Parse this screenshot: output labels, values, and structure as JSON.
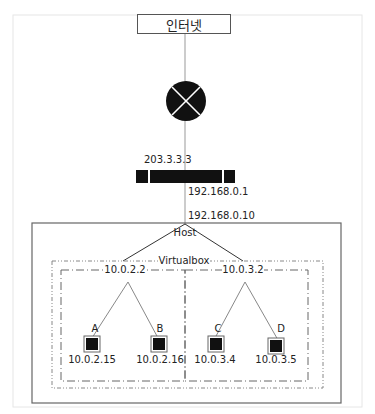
{
  "diagram": {
    "internet": {
      "label": "인터넷"
    },
    "router": {
      "icon": "router-x-icon"
    },
    "gateway": {
      "wan_ip": "203.3.3.3",
      "lan_ip": "192.168.0.1"
    },
    "host": {
      "label": "Host",
      "ip": "192.168.0.10"
    },
    "virtualbox": {
      "label": "Virtualbox"
    },
    "networks": [
      {
        "gateway_ip": "10.0.2.2",
        "vms": [
          {
            "name": "A",
            "ip": "10.0.2.15"
          },
          {
            "name": "B",
            "ip": "10.0.2.16"
          }
        ]
      },
      {
        "gateway_ip": "10.0.3.2",
        "vms": [
          {
            "name": "C",
            "ip": "10.0.3.4"
          },
          {
            "name": "D",
            "ip": "10.0.3.5"
          }
        ]
      }
    ],
    "colors": {
      "line": "#888888",
      "box_border": "#555555",
      "fill": "#111111",
      "frame": "#e4e4e4"
    }
  }
}
